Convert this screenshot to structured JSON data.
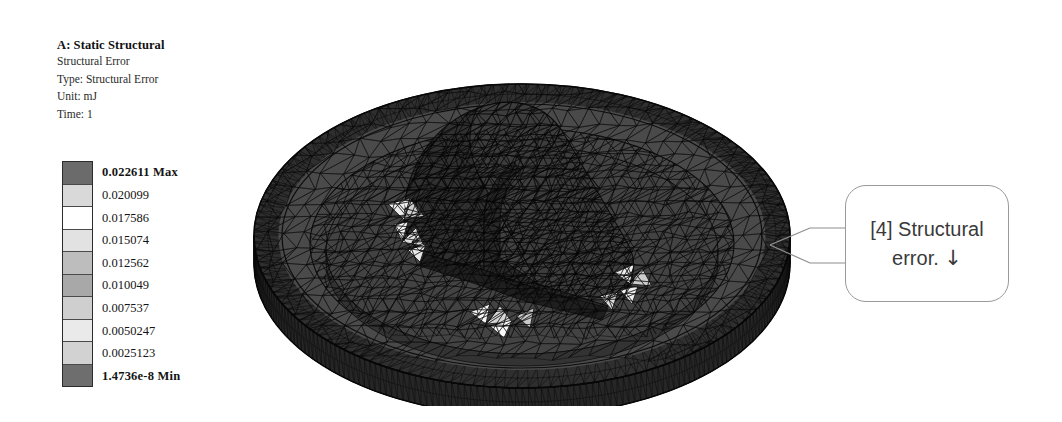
{
  "background_color": "#ffffff",
  "header": {
    "title": "A: Static Structural",
    "lines": [
      "Structural Error",
      "Type: Structural Error",
      "Unit: mJ",
      "Time: 1"
    ]
  },
  "legend": {
    "max_label": "0.022611 Max",
    "min_label": "1.4736e-8 Min",
    "labels": [
      "0.022611 Max",
      "0.020099",
      "0.017586",
      "0.015074",
      "0.012562",
      "0.010049",
      "0.007537",
      "0.0050247",
      "0.0025123",
      "1.4736e-8 Min"
    ],
    "band_colors": [
      "#6b6b6b",
      "#d9d9d9",
      "#ffffff",
      "#e2e2e2",
      "#bdbdbd",
      "#a8a8a8",
      "#cfcfcf",
      "#eaeaea",
      "#d2d2d2",
      "#6e6e6e"
    ],
    "border_color": "#2b2b2b"
  },
  "annotation": {
    "tag": "[4] Structural",
    "line2": "error.",
    "arrow_icon": "↓",
    "border_color": "#9a9a9a",
    "text_color": "#3a3a3a"
  },
  "model": {
    "description": "Triangulated finite-element mesh of a circular disc with raised outer rim, inner annular recess, and central raised block feature with rounded ends, shown in isometric view",
    "mesh_edge_color": "#0a0a0a",
    "surface_fill_top": "#4c4c4c",
    "surface_fill_recess": "#454545",
    "surface_fill_rim": "#2c2c2c",
    "surface_fill_block": "#3a3a3a",
    "hotspot_color": "#f2f2f2"
  },
  "chart_data": {
    "type": "heatmap",
    "subtitle": "Type: Structural Error",
    "unit": "mJ",
    "time": "1",
    "legend_position": "left",
    "grid": false,
    "colorbar": {
      "orientation": "vertical",
      "bands": 10,
      "min": 1.4736e-08,
      "max": 0.022611,
      "min_label": "1.4736e-8 Min",
      "max_label": "0.022611 Max",
      "tick_labels": [
        "0.022611 Max",
        "0.020099",
        "0.017586",
        "0.015074",
        "0.012562",
        "0.010049",
        "0.007537",
        "0.0050247",
        "0.0025123",
        "1.4736e-8 Min"
      ],
      "tick_values": [
        0.022611,
        0.020099,
        0.017586,
        0.015074,
        0.012562,
        0.010049,
        0.007537,
        0.0050247,
        0.0025123,
        1.4736e-08
      ],
      "band_colors": [
        "#6b6b6b",
        "#d9d9d9",
        "#ffffff",
        "#e2e2e2",
        "#bdbdbd",
        "#a8a8a8",
        "#cfcfcf",
        "#eaeaea",
        "#d2d2d2",
        "#6e6e6e"
      ]
    },
    "annotations": [
      {
        "label": "[4] Structural error.",
        "arrow": "↓",
        "points_to": "disc outer rim, right edge"
      }
    ]
  }
}
